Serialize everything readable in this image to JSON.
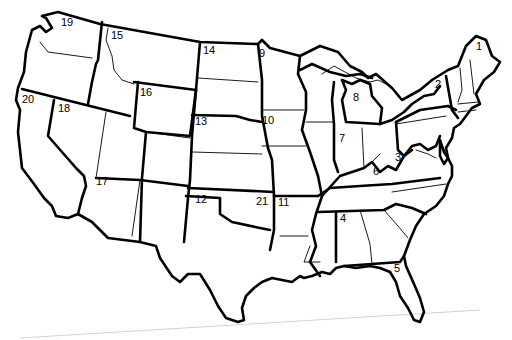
{
  "map": {
    "title": "",
    "subject": "Contiguous United States divided into numbered regions",
    "line_color": "#000000",
    "background": "#ffffff",
    "region_labels": [
      {
        "id": "1",
        "text": "1",
        "x": 476,
        "y": 50
      },
      {
        "id": "2",
        "text": "2",
        "x": 435,
        "y": 88
      },
      {
        "id": "3",
        "text": "3",
        "x": 395,
        "y": 161
      },
      {
        "id": "4",
        "text": "4",
        "x": 340,
        "y": 222
      },
      {
        "id": "5",
        "text": "5",
        "x": 394,
        "y": 272
      },
      {
        "id": "6",
        "text": "6",
        "x": 373,
        "y": 175
      },
      {
        "id": "7",
        "text": "7",
        "x": 339,
        "y": 142
      },
      {
        "id": "8",
        "text": "8",
        "x": 353,
        "y": 101
      },
      {
        "id": "9",
        "text": "9",
        "x": 259,
        "y": 57
      },
      {
        "id": "10",
        "text": "10",
        "x": 262,
        "y": 124
      },
      {
        "id": "11",
        "text": "11",
        "x": 278,
        "y": 206
      },
      {
        "id": "12",
        "text": "12",
        "x": 195,
        "y": 203
      },
      {
        "id": "13",
        "text": "13",
        "x": 195,
        "y": 125
      },
      {
        "id": "14",
        "text": "14",
        "x": 203,
        "y": 54
      },
      {
        "id": "15",
        "text": "15",
        "x": 111,
        "y": 39
      },
      {
        "id": "16",
        "text": "16",
        "x": 140,
        "y": 96
      },
      {
        "id": "17",
        "text": "17",
        "x": 96,
        "y": 185
      },
      {
        "id": "18",
        "text": "18",
        "x": 58,
        "y": 112
      },
      {
        "id": "19",
        "text": "19",
        "x": 61,
        "y": 26
      },
      {
        "id": "20",
        "text": "20",
        "x": 22,
        "y": 103
      },
      {
        "id": "21",
        "text": "21",
        "x": 256,
        "y": 205
      }
    ]
  }
}
